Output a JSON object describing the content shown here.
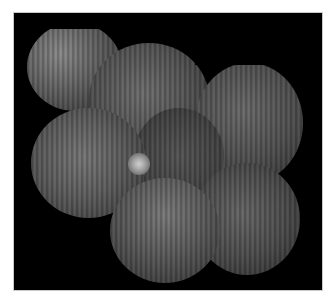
{
  "image": {
    "description": "Grayscale fundus autofluorescence montage of overlapping circular retinal fields on black background",
    "background_color": "#000000",
    "border_color": "#c8c8c8",
    "page_color": "#ffffff",
    "features": [
      "optic-disc",
      "retinal-montage-tiles",
      "vertical-striping-artifact"
    ]
  }
}
